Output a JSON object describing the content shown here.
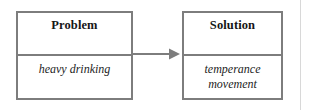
{
  "diagram": {
    "type": "problem-solution-flow",
    "title": "",
    "background_color": "#ffffff",
    "border_color": "#7d7d7d",
    "text_color": "#161616",
    "page_rule_color": "#d8d8d8",
    "nodes": [
      {
        "id": "problem",
        "header": "Problem",
        "body": "heavy drinking"
      },
      {
        "id": "solution",
        "header": "Solution",
        "body": "temperance\nmovement"
      }
    ],
    "connector": {
      "icon": "right-arrow-icon",
      "from": "problem",
      "to": "solution",
      "label": ""
    }
  }
}
